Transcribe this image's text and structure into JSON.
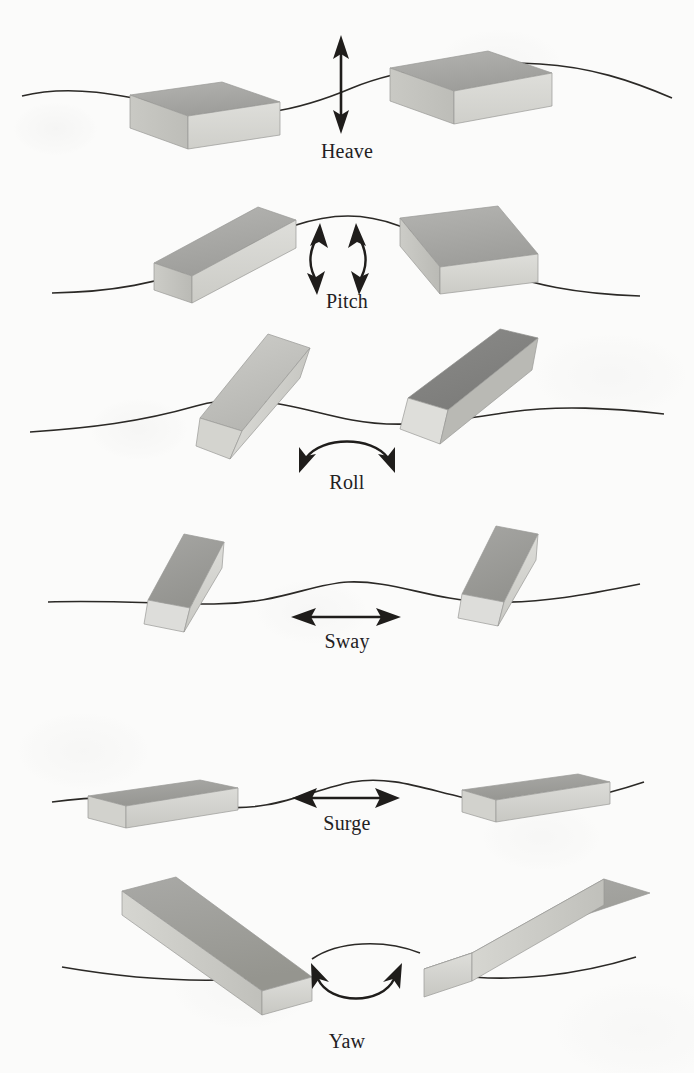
{
  "figure": {
    "background_color": "#fbfbfa",
    "ink_color": "#23211f",
    "box_colors": {
      "top_face": "#a8a8a6",
      "top_face_dark": "#818180",
      "front_face": "#d9d9d5",
      "side_face": "#c3c3bf",
      "outline": "#9a9a97"
    }
  },
  "panels": [
    {
      "id": "heave",
      "label": "Heave",
      "motion_type": "translation",
      "axis": "vertical",
      "arrow": "double-headed-straight-vertical",
      "description": "Vertical up-and-down translation; two flat boxes shown at a wave trough and a wave crest",
      "boxes": [
        {
          "position": "left",
          "state": "low",
          "orientation": "flat-level"
        },
        {
          "position": "right",
          "state": "high",
          "orientation": "flat-level"
        }
      ]
    },
    {
      "id": "pitch",
      "label": "Pitch",
      "motion_type": "rotation",
      "axis": "transverse",
      "arrow": "two-curved-double-headed-vertical",
      "description": "Rotation about the transverse axis; bow-up and bow-down boxes either side of a wave crest",
      "boxes": [
        {
          "position": "left",
          "state": "bow-up",
          "orientation": "tilted-up-right"
        },
        {
          "position": "right",
          "state": "bow-down",
          "orientation": "tilted-down-right"
        }
      ]
    },
    {
      "id": "roll",
      "label": "Roll",
      "motion_type": "rotation",
      "axis": "longitudinal",
      "arrow": "arched-double-headed-down",
      "description": "Rotation about the longitudinal axis; boxes heeled steeply to port and starboard",
      "boxes": [
        {
          "position": "left",
          "state": "heeled-left",
          "orientation": "steep-tilt-left"
        },
        {
          "position": "right",
          "state": "heeled-right",
          "orientation": "steep-tilt-right"
        }
      ]
    },
    {
      "id": "sway",
      "label": "Sway",
      "motion_type": "translation",
      "axis": "transverse",
      "arrow": "double-headed-straight-horizontal",
      "description": "Side-to-side translation; narrow end-on boxes at two lateral positions",
      "boxes": [
        {
          "position": "left",
          "state": "displaced-left",
          "orientation": "end-on-tilted"
        },
        {
          "position": "right",
          "state": "displaced-right",
          "orientation": "end-on-tilted"
        }
      ]
    },
    {
      "id": "surge",
      "label": "Surge",
      "motion_type": "translation",
      "axis": "longitudinal",
      "arrow": "double-headed-straight-horizontal",
      "description": "Fore-and-aft translation; elongated level boxes at two longitudinal positions",
      "boxes": [
        {
          "position": "left",
          "state": "aft",
          "orientation": "long-level"
        },
        {
          "position": "right",
          "state": "forward",
          "orientation": "long-level"
        }
      ]
    },
    {
      "id": "yaw",
      "label": "Yaw",
      "motion_type": "rotation",
      "axis": "vertical",
      "arrow": "u-shaped-double-headed-up",
      "description": "Rotation about the vertical axis; long boxes swung to port and starboard headings",
      "boxes": [
        {
          "position": "left",
          "state": "swung-left",
          "orientation": "long-angled-down-right"
        },
        {
          "position": "right",
          "state": "swung-right",
          "orientation": "long-angled-up-right"
        }
      ]
    }
  ]
}
